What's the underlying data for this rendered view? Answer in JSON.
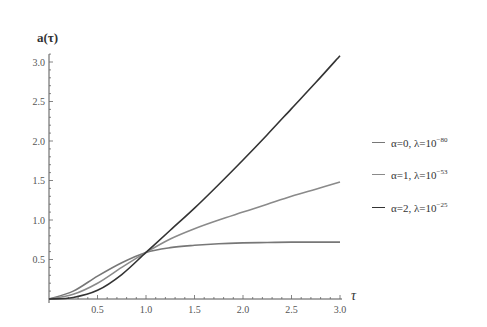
{
  "chart_data": {
    "type": "line",
    "title": "",
    "xlabel": "τ",
    "ylabel": "a(τ)",
    "xlim": [
      0,
      3.0
    ],
    "ylim": [
      0,
      3.1
    ],
    "grid": false,
    "legend_position": "right",
    "x_ticks": [
      "0.5",
      "1.0",
      "1.5",
      "2.0",
      "2.5",
      "3.0"
    ],
    "y_ticks": [
      "0.5",
      "1.0",
      "1.5",
      "2.0",
      "2.5",
      "3.0"
    ],
    "x": [
      0,
      0.25,
      0.5,
      0.75,
      1.0,
      1.25,
      1.5,
      1.75,
      2.0,
      2.25,
      2.5,
      2.75,
      3.0
    ],
    "series": [
      {
        "name": "α=0, λ=10^-80",
        "label_main": "α=0, λ=10",
        "label_exp": "−80",
        "color": "#777777",
        "values": [
          0,
          0.1,
          0.29,
          0.46,
          0.59,
          0.65,
          0.68,
          0.7,
          0.71,
          0.715,
          0.72,
          0.72,
          0.72
        ]
      },
      {
        "name": "α=1, λ=10^-53",
        "label_main": "α=1, λ=10",
        "label_exp": "−53",
        "color": "#8a8a8a",
        "values": [
          0,
          0.06,
          0.2,
          0.4,
          0.59,
          0.76,
          0.89,
          1.0,
          1.1,
          1.2,
          1.3,
          1.39,
          1.48
        ]
      },
      {
        "name": "α=2, λ=10^-25",
        "label_main": "α=2, λ=10",
        "label_exp": "−25",
        "color": "#333333",
        "values": [
          0,
          0.02,
          0.11,
          0.31,
          0.59,
          0.87,
          1.15,
          1.45,
          1.76,
          2.08,
          2.41,
          2.74,
          3.08
        ]
      }
    ]
  }
}
